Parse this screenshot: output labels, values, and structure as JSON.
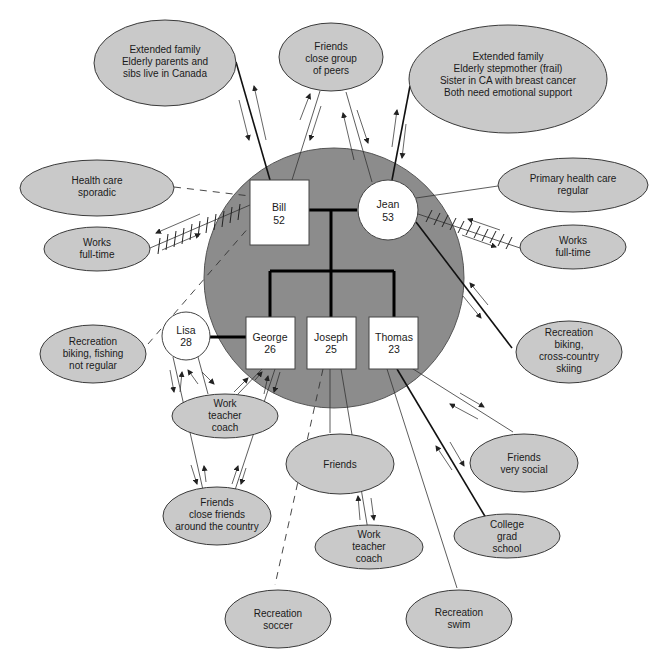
{
  "family": {
    "members": [
      {
        "id": "bill",
        "name": "Bill",
        "age": "52",
        "shape": "square"
      },
      {
        "id": "jean",
        "name": "Jean",
        "age": "53",
        "shape": "circle"
      },
      {
        "id": "george",
        "name": "George",
        "age": "26",
        "shape": "square"
      },
      {
        "id": "joseph",
        "name": "Joseph",
        "age": "25",
        "shape": "square"
      },
      {
        "id": "thomas",
        "name": "Thomas",
        "age": "23",
        "shape": "square"
      },
      {
        "id": "lisa",
        "name": "Lisa",
        "age": "28",
        "shape": "circle"
      }
    ]
  },
  "resources": {
    "bill_extended_family": {
      "lines": [
        "Extended family",
        "Elderly parents and",
        "sibs live in Canada"
      ]
    },
    "bill_friends": {
      "lines": [
        "Friends",
        "close group",
        "of peers"
      ]
    },
    "jean_extended_family": {
      "lines": [
        "Extended family",
        "Elderly stepmother (frail)",
        "Sister in CA with breast cancer",
        "Both need emotional support"
      ]
    },
    "bill_health_care": {
      "lines": [
        "Health care",
        "sporadic"
      ]
    },
    "bill_work": {
      "lines": [
        "Works",
        "full-time"
      ]
    },
    "jean_health_care": {
      "lines": [
        "Primary health care",
        "regular"
      ]
    },
    "jean_work": {
      "lines": [
        "Works",
        "full-time"
      ]
    },
    "jean_recreation": {
      "lines": [
        "Recreation",
        "biking,",
        "cross-country",
        "skiing"
      ]
    },
    "bill_recreation": {
      "lines": [
        "Recreation",
        "biking, fishing",
        "not regular"
      ]
    },
    "george_work": {
      "lines": [
        "Work",
        "teacher",
        "coach"
      ]
    },
    "george_friends": {
      "lines": [
        "Friends",
        "close friends",
        "around the country"
      ]
    },
    "joseph_friends": {
      "lines": [
        "Friends"
      ]
    },
    "joseph_work": {
      "lines": [
        "Work",
        "teacher",
        "coach"
      ]
    },
    "joseph_recreation": {
      "lines": [
        "Recreation",
        "soccer"
      ]
    },
    "thomas_friends": {
      "lines": [
        "Friends",
        "very social"
      ]
    },
    "thomas_college": {
      "lines": [
        "College",
        "grad",
        "school"
      ]
    },
    "thomas_recreation": {
      "lines": [
        "Recreation",
        "swim"
      ]
    }
  },
  "legend_colors": {
    "household_fill": "#8c8c8c",
    "resource_fill": "#c9c9c9",
    "person_fill": "#ffffff"
  }
}
